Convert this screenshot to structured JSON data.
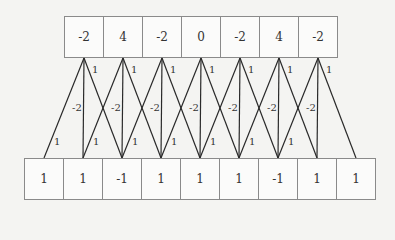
{
  "diagram": {
    "type": "1d-convolution",
    "kernel": [
      1,
      -2,
      1
    ],
    "output_row": [
      "-2",
      "4",
      "-2",
      "0",
      "-2",
      "4",
      "-2"
    ],
    "input_row": [
      "1",
      "1",
      "-1",
      "1",
      "1",
      "1",
      "-1",
      "1",
      "1"
    ],
    "weight_labels": {
      "left": "1",
      "center": "-2",
      "right": "1"
    }
  }
}
